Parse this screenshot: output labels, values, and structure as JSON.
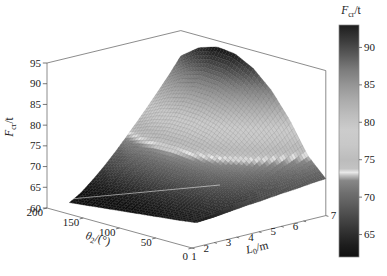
{
  "figure": {
    "background": "#ffffff"
  },
  "chart_data": {
    "type": "surface",
    "title": "",
    "x_axis": {
      "label_pre": "L",
      "label_sub": "0",
      "label_post": "/m",
      "ticks": [
        "1",
        "2",
        "3",
        "4",
        "5",
        "6",
        "7"
      ],
      "range": [
        1,
        7
      ]
    },
    "y_axis": {
      "label_pre": "θ",
      "label_sub": "2",
      "label_post": "/(°)",
      "ticks": [
        "200",
        "150",
        "100",
        "50",
        "0"
      ],
      "range": [
        0,
        200
      ]
    },
    "z_axis": {
      "label_pre": "F",
      "label_sub": "cr",
      "label_post": "/t",
      "ticks": [
        "60",
        "65",
        "70",
        "75",
        "80",
        "85",
        "90",
        "95"
      ],
      "range": [
        60,
        95
      ]
    },
    "colorbar": {
      "label_pre": "F",
      "label_sub": "cr",
      "label_post": "/t",
      "ticks": [
        "90",
        "85",
        "80",
        "75",
        "70",
        "65"
      ],
      "range": [
        62,
        93
      ],
      "gray_stops": [
        [
          62,
          "#101010"
        ],
        [
          63.5,
          "#1c1c1c"
        ],
        [
          65,
          "#2d2d2d"
        ],
        [
          67,
          "#454545"
        ],
        [
          69,
          "#5d5d5d"
        ],
        [
          70.5,
          "#6e6e6e"
        ],
        [
          72.2,
          "#878787"
        ],
        [
          72.9,
          "#c2c2c2"
        ],
        [
          73.3,
          "#e9e9e9"
        ],
        [
          73.8,
          "#c3c3c3"
        ],
        [
          75,
          "#bcbcbc"
        ],
        [
          77,
          "#c8c8c8"
        ],
        [
          79,
          "#cccccc"
        ],
        [
          81,
          "#bdbdbd"
        ],
        [
          83,
          "#ababab"
        ],
        [
          85,
          "#959595"
        ],
        [
          87,
          "#7c7c7c"
        ],
        [
          89,
          "#5a5a5a"
        ],
        [
          91,
          "#3a3a3a"
        ],
        [
          93,
          "#1d1d1d"
        ]
      ]
    },
    "surface": {
      "L_values": [
        2,
        2.5,
        3,
        3.5,
        4,
        4.5,
        5,
        5.5,
        6,
        6.5,
        7
      ],
      "theta_values": [
        0,
        25,
        50,
        75,
        100,
        125,
        150,
        175,
        200
      ],
      "z_grid": [
        [
          66.2,
          66.5,
          66.8,
          67.1,
          67.3,
          67.6,
          67.9,
          68.1,
          68.4,
          68.7,
          68.9
        ],
        [
          63.6,
          64.2,
          64.9,
          65.8,
          66.7,
          67.7,
          68.7,
          69.8,
          70.9,
          72.0,
          73.3
        ],
        [
          63.0,
          64.0,
          65.4,
          66.9,
          68.6,
          70.4,
          72.3,
          74.3,
          76.3,
          78.4,
          80.7
        ],
        [
          62.5,
          63.9,
          65.7,
          67.8,
          70.2,
          72.6,
          75.2,
          77.9,
          80.7,
          83.5,
          86.6
        ],
        [
          62.0,
          63.6,
          65.8,
          68.4,
          71.1,
          74.1,
          77.1,
          80.3,
          83.6,
          87.0,
          90.7
        ],
        [
          61.5,
          63.3,
          65.7,
          68.5,
          71.5,
          74.7,
          78.1,
          81.6,
          85.3,
          89.0,
          93.0
        ],
        [
          61.0,
          62.8,
          65.3,
          68.2,
          71.3,
          74.7,
          78.2,
          81.8,
          85.5,
          89.4,
          93.5
        ],
        [
          60.5,
          62.3,
          64.7,
          67.5,
          70.6,
          73.8,
          77.2,
          80.7,
          84.3,
          88.1,
          92.1
        ],
        [
          60.0,
          61.6,
          63.9,
          66.4,
          69.2,
          72.2,
          75.3,
          78.5,
          81.8,
          85.2,
          88.9
        ]
      ]
    }
  }
}
